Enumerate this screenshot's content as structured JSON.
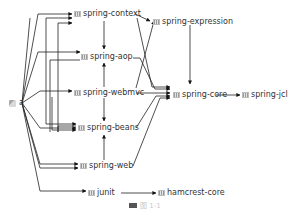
{
  "diagram": {
    "type": "maven-dependency-graph",
    "root": {
      "id": "a",
      "label": "a",
      "icon": "project-icon"
    },
    "nodes": [
      {
        "id": "spring-context",
        "label": "spring-context",
        "icon": "jar-icon"
      },
      {
        "id": "spring-expression",
        "label": "spring-expression",
        "icon": "jar-icon"
      },
      {
        "id": "spring-aop",
        "label": "spring-aop",
        "icon": "jar-icon"
      },
      {
        "id": "spring-webmvc",
        "label": "spring-webmvc",
        "icon": "jar-icon"
      },
      {
        "id": "spring-core",
        "label": "spring-core",
        "icon": "jar-icon"
      },
      {
        "id": "spring-jcl",
        "label": "spring-jcl",
        "icon": "jar-icon"
      },
      {
        "id": "spring-beans",
        "label": "spring-beans",
        "icon": "jar-icon"
      },
      {
        "id": "spring-web",
        "label": "spring-web",
        "icon": "jar-icon"
      },
      {
        "id": "junit",
        "label": "junit",
        "icon": "jar-icon"
      },
      {
        "id": "hamcrest-core",
        "label": "hamcrest-core",
        "icon": "jar-icon"
      }
    ],
    "edges": [
      [
        "a",
        "spring-context"
      ],
      [
        "a",
        "spring-aop"
      ],
      [
        "a",
        "spring-webmvc"
      ],
      [
        "a",
        "spring-beans"
      ],
      [
        "a",
        "spring-web"
      ],
      [
        "a",
        "junit"
      ],
      [
        "spring-context",
        "spring-aop"
      ],
      [
        "spring-context",
        "spring-expression"
      ],
      [
        "spring-context",
        "spring-core"
      ],
      [
        "spring-aop",
        "spring-core"
      ],
      [
        "spring-webmvc",
        "spring-context"
      ],
      [
        "spring-webmvc",
        "spring-aop"
      ],
      [
        "spring-webmvc",
        "spring-beans"
      ],
      [
        "spring-webmvc",
        "spring-expression"
      ],
      [
        "spring-webmvc",
        "spring-core"
      ],
      [
        "spring-webmvc",
        "spring-web"
      ],
      [
        "spring-beans",
        "spring-core"
      ],
      [
        "spring-web",
        "spring-beans"
      ],
      [
        "spring-web",
        "spring-core"
      ],
      [
        "spring-expression",
        "spring-core"
      ],
      [
        "spring-core",
        "spring-jcl"
      ],
      [
        "junit",
        "hamcrest-core"
      ]
    ]
  },
  "caption": {
    "text": "图 1-1"
  }
}
